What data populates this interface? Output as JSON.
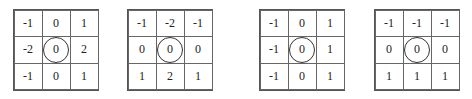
{
  "kernels": [
    {
      "name": "sobel-x",
      "left": 13,
      "cells": [
        "-1",
        "0",
        "1",
        "-2",
        "0",
        "2",
        "-1",
        "0",
        "1"
      ]
    },
    {
      "name": "sobel-y",
      "left": 127,
      "cells": [
        "-1",
        "-2",
        "-1",
        "0",
        "0",
        "0",
        "1",
        "2",
        "1"
      ]
    },
    {
      "name": "prewitt-x",
      "left": 259,
      "cells": [
        "-1",
        "0",
        "1",
        "-1",
        "0",
        "1",
        "-1",
        "0",
        "1"
      ]
    },
    {
      "name": "prewitt-y",
      "left": 374,
      "cells": [
        "-1",
        "-1",
        "-1",
        "0",
        "0",
        "0",
        "1",
        "1",
        "1"
      ]
    }
  ]
}
